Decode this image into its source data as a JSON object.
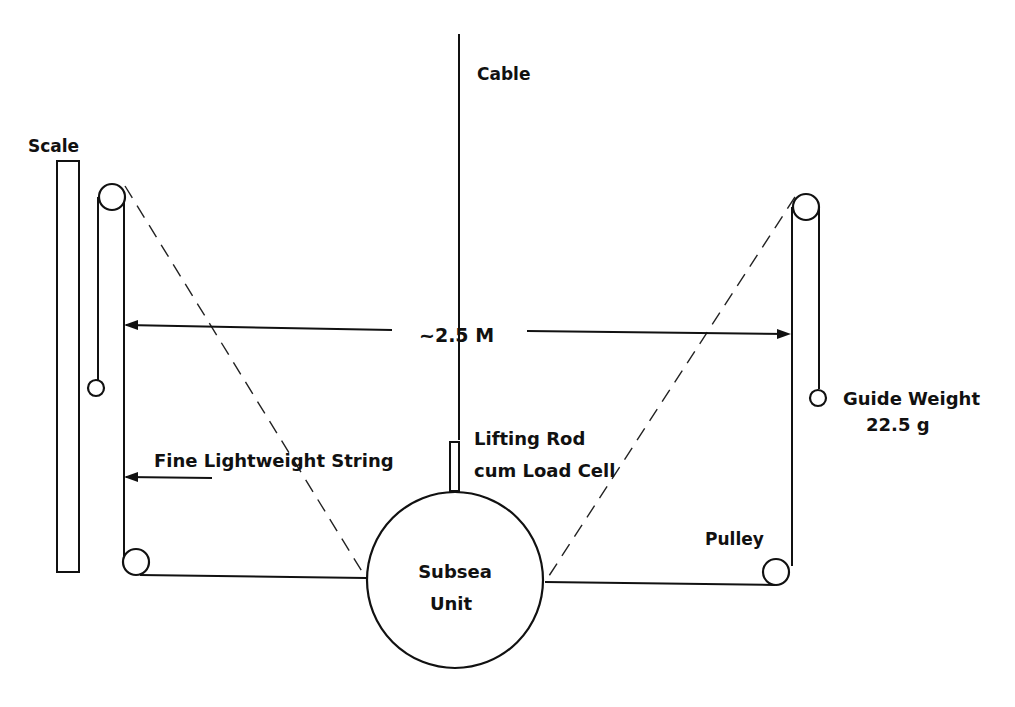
{
  "diagram": {
    "labels": {
      "cable": "Cable",
      "scale": "Scale",
      "distance": "~2.5 M",
      "guide_weight_line1": "Guide Weight",
      "guide_weight_line2": "22.5 g",
      "string": "Fine Lightweight String",
      "lifting_rod_line1": "Lifting Rod",
      "lifting_rod_line2": "cum Load Cell",
      "pulley": "Pulley",
      "subsea_line1": "Subsea",
      "subsea_line2": "Unit"
    },
    "components": [
      {
        "id": "cable",
        "type": "line"
      },
      {
        "id": "scale",
        "type": "rectangle"
      },
      {
        "id": "top-left-pulley",
        "type": "pulley"
      },
      {
        "id": "top-right-pulley",
        "type": "pulley"
      },
      {
        "id": "bottom-left-pulley",
        "type": "pulley"
      },
      {
        "id": "bottom-right-pulley",
        "type": "pulley"
      },
      {
        "id": "left-guide-weight",
        "type": "weight"
      },
      {
        "id": "right-guide-weight",
        "type": "weight"
      },
      {
        "id": "lifting-rod",
        "type": "rod"
      },
      {
        "id": "subsea-unit",
        "type": "circle"
      }
    ],
    "colors": {
      "ink": "#111111",
      "background": "#ffffff"
    }
  }
}
